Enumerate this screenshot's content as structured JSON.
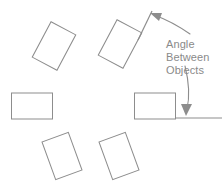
{
  "figure": {
    "width": 222,
    "height": 182,
    "background_color": "#ffffff",
    "object_stroke_color": "#8d8d8d",
    "reference_line_color": "#8d8d8d",
    "leader_color": "#8d8d8d",
    "text_color": "#8a8a8a"
  },
  "callout": {
    "line1": "Angle",
    "line2": "Between",
    "line3": "Objects"
  },
  "objects": [
    {
      "name": "rectangle-top-left",
      "cx": 54,
      "cy": 46,
      "w": 28,
      "h": 40,
      "rotation": 28
    },
    {
      "name": "rectangle-top-center",
      "cx": 120,
      "cy": 44,
      "w": 28,
      "h": 40,
      "rotation": 28
    },
    {
      "name": "rectangle-middle-left",
      "cx": 32,
      "cy": 106,
      "w": 41,
      "h": 26,
      "rotation": 0
    },
    {
      "name": "rectangle-middle-right",
      "cx": 155,
      "cy": 106,
      "w": 41,
      "h": 26,
      "rotation": 0
    },
    {
      "name": "rectangle-bottom-left",
      "cx": 62,
      "cy": 156,
      "w": 28,
      "h": 40,
      "rotation": -20
    },
    {
      "name": "rectangle-bottom-right",
      "cx": 119,
      "cy": 156,
      "w": 28,
      "h": 40,
      "rotation": -20
    }
  ],
  "reference_lines": [
    {
      "name": "tilted-reference-line",
      "x1": 138,
      "y1": 40,
      "x2": 152,
      "y2": 11
    },
    {
      "name": "horizontal-reference-line",
      "x1": 176,
      "y1": 118,
      "x2": 222,
      "y2": 118
    }
  ],
  "leaders": [
    {
      "name": "leader-to-tilted-line",
      "path": "M 190 34 C 180 27 168 20 154 15",
      "arrow_points": "150,13 162,13 159,21"
    },
    {
      "name": "leader-to-horizontal-line",
      "path": "M 185 66 C 189 82 190 96 187 109",
      "arrow_points": "186,116 181,104 192,104"
    }
  ]
}
